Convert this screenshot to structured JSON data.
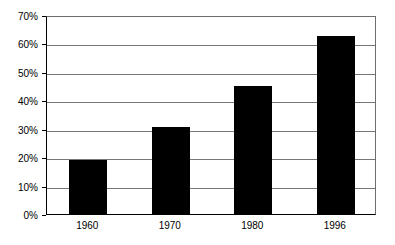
{
  "chart_data": {
    "type": "bar",
    "title": "",
    "subtitle": "",
    "xlabel": "",
    "ylabel": "",
    "categories": [
      "1960",
      "1970",
      "1980",
      "1996"
    ],
    "values": [
      19,
      30.5,
      45,
      62.5
    ],
    "value_labels": [
      "19%",
      "30.5%",
      "45%",
      "62.5%"
    ],
    "series": [
      {
        "name": "",
        "values": [
          19,
          30.5,
          45,
          62.5
        ],
        "color": "#000000"
      }
    ],
    "ylim": [
      0,
      70
    ],
    "ytick_values": [
      0,
      10,
      20,
      30,
      40,
      50,
      60,
      70
    ],
    "ytick_labels": [
      "0%",
      "10%",
      "20%",
      "30%",
      "40%",
      "50%",
      "60%",
      "70%"
    ],
    "grid": true,
    "grid_axis": "y",
    "legend": false,
    "legend_position": "none",
    "bar_color": "#000000",
    "plot_background": "#ffffff",
    "axis_color": "#000000",
    "grid_color": "#777777",
    "annotations": []
  },
  "axes": {
    "y_axis_name": "percent-axis",
    "x_axis_name": "year-axis"
  }
}
